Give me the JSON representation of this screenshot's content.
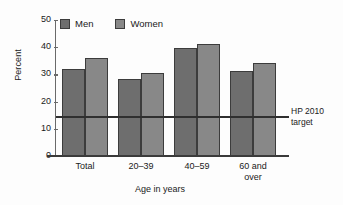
{
  "chart_data": {
    "type": "bar",
    "title": "",
    "subtitle": "",
    "xlabel": "Age in years",
    "ylabel": "Percent",
    "categories": [
      "Total",
      "20–39",
      "40–59",
      "60 and\nover"
    ],
    "series": [
      {
        "name": "Men",
        "color": "#6e6e6e",
        "values": [
          32.0,
          28.3,
          39.7,
          31.4
        ]
      },
      {
        "name": "Women",
        "color": "#888888",
        "values": [
          36.0,
          30.7,
          41.0,
          34.2
        ]
      }
    ],
    "ylim": [
      0,
      50
    ],
    "yticks": [
      0,
      10,
      20,
      30,
      40,
      50
    ],
    "ytick_labels": [
      "0",
      "10",
      "20",
      "30",
      "40",
      "50"
    ],
    "grid": false,
    "legend_position": "top-left",
    "annotations": [
      {
        "name": "hp-2010-target",
        "type": "horizontal-line",
        "value": 14.6,
        "label_line1": "HP 2010",
        "label_line2": "target",
        "color": "#2f2f2f"
      }
    ]
  },
  "legend": {
    "entries": [
      {
        "label": "Men",
        "color": "#6e6e6e"
      },
      {
        "label": "Women",
        "color": "#888888"
      }
    ]
  },
  "axes": {
    "y_title": "Percent",
    "x_title": "Age in years",
    "y_ticks": [
      "50",
      "40",
      "30",
      "20",
      "10",
      "0"
    ],
    "x_ticks": [
      {
        "line1": "Total",
        "line2": ""
      },
      {
        "line1": "20–39",
        "line2": ""
      },
      {
        "line1": "40–59",
        "line2": ""
      },
      {
        "line1": "60 and",
        "line2": "over"
      }
    ]
  },
  "target": {
    "line1": "HP 2010",
    "line2": "target"
  }
}
